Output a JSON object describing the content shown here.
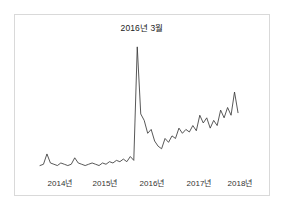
{
  "chart_data": {
    "type": "line",
    "title": "",
    "subtitle": "",
    "xlabel": "",
    "ylabel": "",
    "grid": false,
    "legend": null,
    "annotations": [
      {
        "name": "spike-label",
        "text": "2016년 3월",
        "x": "2016-03",
        "note": "레이블이 최대 스파이크 위에 표시됨"
      }
    ],
    "xticks": [
      "2014년",
      "2015년",
      "2016년",
      "2017년",
      "2018년"
    ],
    "xlim": [
      "2013-10",
      "2018-10"
    ],
    "ylim": [
      0,
      100
    ],
    "series": [
      {
        "name": "검색량",
        "color": "#3a3a3a",
        "x": [
          "2013-11",
          "2013-12",
          "2014-01",
          "2014-02",
          "2014-03",
          "2014-04",
          "2014-05",
          "2014-06",
          "2014-07",
          "2014-08",
          "2014-09",
          "2014-10",
          "2014-11",
          "2014-12",
          "2015-01",
          "2015-02",
          "2015-03",
          "2015-04",
          "2015-05",
          "2015-06",
          "2015-07",
          "2015-08",
          "2015-09",
          "2015-10",
          "2015-11",
          "2015-12",
          "2016-01",
          "2016-02",
          "2016-03",
          "2016-04",
          "2016-05",
          "2016-06",
          "2016-07",
          "2016-08",
          "2016-09",
          "2016-10",
          "2016-11",
          "2016-12",
          "2017-01",
          "2017-02",
          "2017-03",
          "2017-04",
          "2017-05",
          "2017-06",
          "2017-07",
          "2017-08",
          "2017-09",
          "2017-10",
          "2017-11",
          "2017-12",
          "2018-01",
          "2018-02",
          "2018-03",
          "2018-04",
          "2018-05",
          "2018-06",
          "2018-07",
          "2018-08"
        ],
        "values": [
          5,
          6,
          14,
          7,
          6,
          5,
          7,
          6,
          5,
          6,
          11,
          7,
          6,
          5,
          6,
          7,
          6,
          5,
          7,
          6,
          8,
          7,
          9,
          8,
          10,
          8,
          12,
          9,
          97,
          45,
          40,
          30,
          33,
          24,
          20,
          18,
          26,
          23,
          28,
          26,
          34,
          30,
          33,
          31,
          36,
          32,
          44,
          38,
          42,
          34,
          40,
          36,
          48,
          42,
          50,
          44,
          62,
          46
        ]
      }
    ]
  },
  "axis": {
    "tick_positions_px": [
      60,
      105,
      152,
      199,
      240
    ],
    "baseline_y_px": 172
  }
}
